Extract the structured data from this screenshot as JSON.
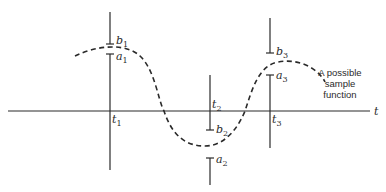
{
  "diagram": {
    "axis_label": "t",
    "caption": {
      "lines": [
        "A possible",
        "sample",
        "function"
      ]
    },
    "time_points": [
      {
        "label": "t",
        "sub": "1",
        "upper": {
          "label": "b",
          "sub": "1"
        },
        "lower": {
          "label": "a",
          "sub": "1"
        }
      },
      {
        "label": "t",
        "sub": "2",
        "upper": {
          "label": "b",
          "sub": "2"
        },
        "lower": {
          "label": "a",
          "sub": "2"
        }
      },
      {
        "label": "t",
        "sub": "3",
        "upper": {
          "label": "b",
          "sub": "3"
        },
        "lower": {
          "label": "a",
          "sub": "3"
        }
      }
    ],
    "colors": {
      "line": "#2a2a2a",
      "background": "#ffffff"
    }
  }
}
